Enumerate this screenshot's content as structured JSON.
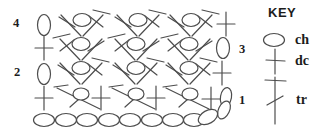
{
  "colors": {
    "ink": "#4d4d4d",
    "text": "#1c1c1c",
    "background": "#ffffff"
  },
  "key": {
    "title": "KEY",
    "title_pos": {
      "x": 268,
      "y": 6
    },
    "entries": [
      {
        "label": "ch",
        "glyph": "ch-h",
        "glyph_x": 274,
        "glyph_y": 40,
        "label_pos": {
          "x": 295,
          "y": 33
        }
      },
      {
        "label": "dc",
        "glyph": "dc-key",
        "glyph_x": 275,
        "glyph_y": 61,
        "label_pos": {
          "x": 295,
          "y": 54
        }
      },
      {
        "label": "tr",
        "glyph": "tr-key",
        "glyph_x": 275,
        "glyph_y": 100,
        "label_pos": {
          "x": 296,
          "y": 93
        }
      }
    ]
  },
  "row_numbers": [
    {
      "label": "4",
      "x": 13,
      "y": 17
    },
    {
      "label": "3",
      "x": 239,
      "y": 43
    },
    {
      "label": "2",
      "x": 14,
      "y": 66
    },
    {
      "label": "1",
      "x": 239,
      "y": 94
    }
  ],
  "diagram": {
    "width": 333,
    "height": 131,
    "rows_top_to_bottom": [
      "row-4",
      "row-3",
      "row-2",
      "row-1",
      "foundation-chain"
    ],
    "symbols": [
      {
        "type": "ch-v",
        "x": 44,
        "y": 25,
        "row": "row-4"
      },
      {
        "type": "fan",
        "x": 82,
        "y": 20,
        "row": "row-4"
      },
      {
        "type": "fan",
        "x": 138,
        "y": 20,
        "row": "row-4"
      },
      {
        "type": "fan",
        "x": 191,
        "y": 20,
        "row": "row-4"
      },
      {
        "type": "dc",
        "x": 226,
        "y": 24,
        "row": "row-4"
      },
      {
        "type": "dc",
        "x": 44,
        "y": 48,
        "row": "row-3"
      },
      {
        "type": "fan",
        "x": 81,
        "y": 44,
        "mirror": true,
        "row": "row-3"
      },
      {
        "type": "fan",
        "x": 136,
        "y": 44,
        "mirror": true,
        "row": "row-3"
      },
      {
        "type": "fan",
        "x": 189,
        "y": 44,
        "mirror": true,
        "row": "row-3"
      },
      {
        "type": "ch-v",
        "x": 223,
        "y": 48,
        "row": "row-3"
      },
      {
        "type": "ch-v",
        "x": 44,
        "y": 74,
        "row": "row-2"
      },
      {
        "type": "fan",
        "x": 81,
        "y": 68,
        "row": "row-2"
      },
      {
        "type": "fan",
        "x": 136,
        "y": 68,
        "row": "row-2"
      },
      {
        "type": "fan",
        "x": 189,
        "y": 68,
        "row": "row-2"
      },
      {
        "type": "dc",
        "x": 222,
        "y": 73,
        "row": "row-2"
      },
      {
        "type": "dc",
        "x": 44,
        "y": 98,
        "row": "row-1"
      },
      {
        "type": "xtr",
        "x": 81,
        "y": 94,
        "row": "row-1"
      },
      {
        "type": "dc",
        "x": 101,
        "y": 98,
        "row": "row-1"
      },
      {
        "type": "xtr",
        "x": 136,
        "y": 94,
        "row": "row-1"
      },
      {
        "type": "dc",
        "x": 156,
        "y": 98,
        "row": "row-1"
      },
      {
        "type": "xtr",
        "x": 190,
        "y": 94,
        "row": "row-1"
      },
      {
        "type": "dc",
        "x": 211,
        "y": 99,
        "row": "row-1"
      },
      {
        "type": "ch-t",
        "x": 226,
        "y": 97,
        "rot": 10,
        "row": "row-1"
      },
      {
        "type": "ch-t",
        "x": 224,
        "y": 110,
        "rot": 25,
        "row": "row-1"
      },
      {
        "type": "ch-h",
        "x": 44,
        "y": 120,
        "row": "foundation-chain"
      },
      {
        "type": "ch-h",
        "x": 66,
        "y": 120,
        "row": "foundation-chain"
      },
      {
        "type": "ch-h",
        "x": 87,
        "y": 120,
        "row": "foundation-chain"
      },
      {
        "type": "ch-h",
        "x": 109,
        "y": 120,
        "row": "foundation-chain"
      },
      {
        "type": "ch-h",
        "x": 130,
        "y": 120,
        "row": "foundation-chain"
      },
      {
        "type": "ch-h",
        "x": 152,
        "y": 120,
        "row": "foundation-chain"
      },
      {
        "type": "ch-h",
        "x": 173,
        "y": 120,
        "row": "foundation-chain"
      },
      {
        "type": "ch-h",
        "x": 194,
        "y": 120,
        "row": "foundation-chain"
      },
      {
        "type": "ch-h",
        "x": 208,
        "y": 117,
        "rot": -30,
        "row": "foundation-chain"
      }
    ]
  }
}
